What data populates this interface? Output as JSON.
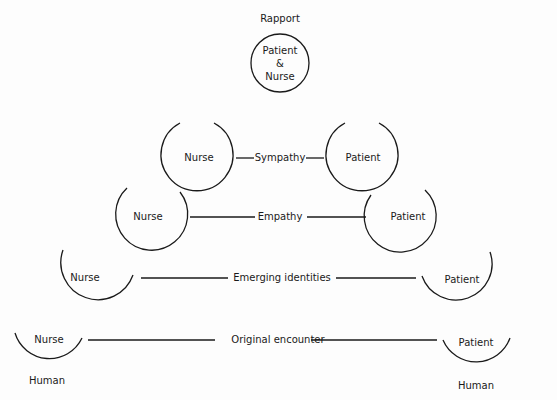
{
  "diagram": {
    "top": {
      "title": "Rapport",
      "circle_lines": [
        "Patient",
        "&",
        "Nurse"
      ]
    },
    "levels": [
      {
        "name": "Sympathy",
        "left": "Nurse",
        "right": "Patient"
      },
      {
        "name": "Empathy",
        "left": "Nurse",
        "right": "Patient"
      },
      {
        "name": "Emerging identities",
        "left": "Nurse",
        "right": "Patient"
      },
      {
        "name": "Original encounter",
        "left": "Nurse",
        "right": "Patient"
      }
    ],
    "bottom_labels": {
      "left": "Human",
      "right": "Human"
    }
  },
  "colors": {
    "ink": "#1a1a1a",
    "background": "#fdfdfd"
  }
}
